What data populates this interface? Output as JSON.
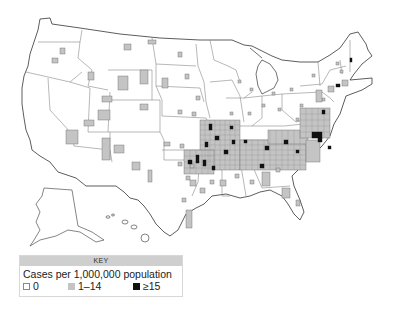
{
  "map": {
    "title": "Cases per 1,000,000 population by county, United States",
    "colors": {
      "zero": "#ffffff",
      "low": "#c4c4c4",
      "high": "#111111",
      "border": "#555555",
      "state_border": "#888888"
    }
  },
  "key": {
    "header": "KEY",
    "title": "Cases per 1,000,000 population",
    "items": [
      {
        "label": "0",
        "swatch": "white"
      },
      {
        "label": "1–14",
        "swatch": "gray"
      },
      {
        "label": "≥15",
        "swatch": "black"
      }
    ]
  }
}
